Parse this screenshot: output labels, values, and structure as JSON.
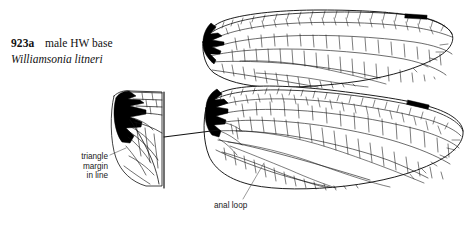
{
  "plate": {
    "figure_number": "923a",
    "caption": "male HW base",
    "species": "Williamsonia litneri",
    "ghost_text": "",
    "annotations": {
      "triangle": "triangle",
      "margin": "margin",
      "in_line": "in line",
      "anal_loop": "anal loop"
    },
    "colors": {
      "ink": "#111111",
      "background": "#ffffff",
      "dark_marking": "#000000"
    },
    "figures": [
      {
        "name": "forewing",
        "label": "male forewing venation",
        "pterostigma": "dark",
        "base_marking": "dark-wedge"
      },
      {
        "name": "hindwing",
        "label": "male hindwing venation",
        "pterostigma": "dark",
        "base_marking": "dark-wedge"
      },
      {
        "name": "hindwing-base-inset",
        "label": "magnified male HW base",
        "bracket": "vertical-line"
      }
    ]
  }
}
